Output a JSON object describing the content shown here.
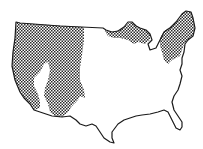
{
  "map": {
    "subject": "Contiguous United States outline",
    "colors": {
      "background": "#ffffff",
      "outline": "#1a1a1a",
      "hatch": "#2a2a2a"
    },
    "legend": [],
    "regions": [
      {
        "id": "west",
        "label": "Western mountain region",
        "pattern": "crosshatch"
      },
      {
        "id": "great-lakes",
        "label": "Upper Great Lakes region",
        "pattern": "crosshatch"
      },
      {
        "id": "northeast",
        "label": "Northeast / New England region",
        "pattern": "crosshatch"
      }
    ]
  }
}
